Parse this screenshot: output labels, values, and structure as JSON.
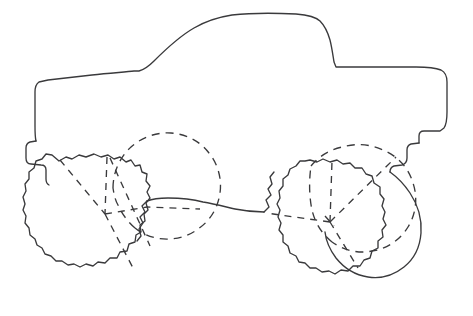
{
  "artwork": {
    "title": "Monster Truck",
    "subject": "monster-truck-outline",
    "style": "coloring-book line drawing",
    "background_color": "#ffffff",
    "line_color": "#3a3a3c",
    "line_width_px": 1.35,
    "canvas": {
      "width": 473,
      "height": 316
    },
    "alt_text": "Black outline drawing of a monster truck with four oversized knobby tires, drawn with dashed lines showing the far-side wheels"
  },
  "parts": [
    {
      "id": "truck-body",
      "label": "Truck body",
      "stroke": "solid",
      "description": "Cab, hood, bed and bumpers silhouette"
    },
    {
      "id": "front-near-wheel",
      "label": "Front near-side wheel",
      "stroke": "solid",
      "description": "Knobby tire, left front, visible side"
    },
    {
      "id": "front-far-wheel",
      "label": "Front far-side wheel",
      "stroke": "dashed",
      "description": "Hidden tire behind the truck, shown dashed"
    },
    {
      "id": "rear-near-wheel",
      "label": "Rear near-side wheel",
      "stroke": "solid",
      "description": "Knobby tire, right rear, visible side"
    },
    {
      "id": "rear-far-wheel",
      "label": "Rear far-side wheel",
      "stroke": "dashed",
      "description": "Hidden tire behind the truck, shown dashed"
    },
    {
      "id": "chassis-axle-line",
      "label": "Chassis / axle line",
      "stroke": "solid",
      "description": "Low frame rail linking the front and rear wheel groups"
    },
    {
      "id": "front-hub-spokes",
      "label": "Front hub spokes",
      "stroke": "dashed",
      "description": "Dashed hub and spoke lines on the front axle"
    },
    {
      "id": "rear-hub-spokes",
      "label": "Rear hub spokes",
      "stroke": "dashed",
      "description": "Dashed hub and spoke lines on the rear axle"
    }
  ],
  "geometry": {
    "body_outline_path": "M 308,16 C 296,15 272,16 254,22 C 236,28 210,44 196,54 C 183,63 173,70 167,71 L 121,71 C 116,71 112,72 109,76 C 105,81 103,88 103,95 L 103,105 L 97,106 C 94,107 92,109 92,113 L 92,122 C 92,126 93,128 96,129 L 103,130 L 103,140 C 103,143 101,145 98,145",
    "front_wheel": {
      "cx": 79,
      "cy": 219,
      "r": 66
    },
    "front_far_wheel": {
      "cx": 167,
      "cy": 198,
      "r": 54
    },
    "rear_wheel": {
      "cx": 334,
      "cy": 222,
      "r": 62
    },
    "rear_far_wheel": {
      "cx": 383,
      "cy": 207,
      "r": 57
    },
    "axle_line_y": 206
  }
}
